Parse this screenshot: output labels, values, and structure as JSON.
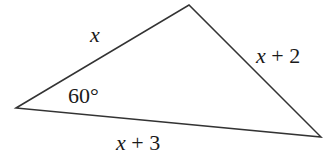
{
  "diagram": {
    "type": "triangle",
    "vertices": {
      "left": [
        16,
        108
      ],
      "top": [
        189,
        5
      ],
      "right": [
        321,
        137
      ]
    },
    "sides": {
      "left_top": {
        "var": "x",
        "rest": ""
      },
      "top_right": {
        "var": "x",
        "rest": " + 2"
      },
      "left_right": {
        "var": "x",
        "rest": " + 3"
      }
    },
    "angle": {
      "vertex": "left",
      "label": "60°"
    },
    "colors": {
      "stroke": "#333333",
      "text": "#1a1a1a"
    }
  }
}
